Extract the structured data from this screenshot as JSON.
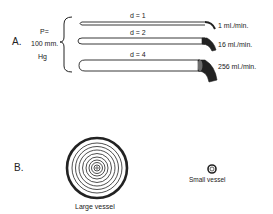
{
  "panels": {
    "a": {
      "label": "A.",
      "pressure": {
        "line1": "P=",
        "line2": "100 mm.",
        "line3": "Hg"
      },
      "tubes": [
        {
          "diameter_label": "d = 1",
          "flow_label": "1 ml./min."
        },
        {
          "diameter_label": "d = 2",
          "flow_label": "16 ml./min."
        },
        {
          "diameter_label": "d = 4",
          "flow_label": "256 ml./min."
        }
      ]
    },
    "b": {
      "label": "B.",
      "large_vessel_label": "Large vessel",
      "small_vessel_label": "Small vessel"
    }
  },
  "colors": {
    "ink": "#222222",
    "background": "#ffffff"
  }
}
